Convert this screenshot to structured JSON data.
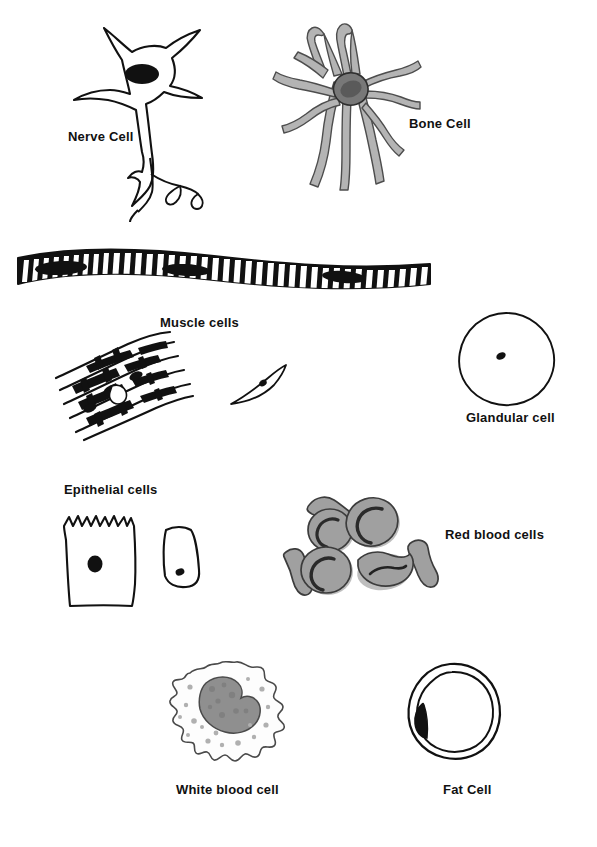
{
  "diagram": {
    "background_color": "#ffffff",
    "ink_color": "#111111",
    "gray_fill": "#a0a0a0",
    "gray_dark": "#6e6e6e",
    "gray_light": "#c8c8c8"
  },
  "cells": [
    {
      "id": "nerve-cell",
      "label": "Nerve Cell",
      "label_x": 68,
      "label_y": 130,
      "description": "Star-shaped neuron soma with black oval nucleus and long branching axon"
    },
    {
      "id": "bone-cell",
      "label": "Bone Cell",
      "label_x": 409,
      "label_y": 117,
      "description": "Osteocyte with gray body and many long branching processes"
    },
    {
      "id": "muscle-cells",
      "label": "Muscle cells",
      "label_x": 160,
      "label_y": 316,
      "description": "Long striated skeletal muscle fiber with dark banding"
    },
    {
      "id": "cardiac-muscle",
      "label": "",
      "label_x": 0,
      "label_y": 0,
      "description": "Branching cardiac muscle fibers with intercalated discs"
    },
    {
      "id": "smooth-muscle-cell",
      "label": "",
      "label_x": 0,
      "label_y": 0,
      "description": "Single spindle-shaped smooth muscle cell with central nucleus"
    },
    {
      "id": "glandular-cell",
      "label": "Glandular cell",
      "label_x": 466,
      "label_y": 411,
      "description": "Round cell outline with small dark central nucleus"
    },
    {
      "id": "epithelial-cells",
      "label": "Epithelial cells",
      "label_x": 64,
      "label_y": 483,
      "description": "Large square cell with microvilli and smaller trapezoid cell"
    },
    {
      "id": "red-blood-cells",
      "label": "Red blood cells",
      "label_x": 445,
      "label_y": 528,
      "description": "Gray biconcave discs with crescent depressions and edge-on views"
    },
    {
      "id": "white-blood-cell",
      "label": "White blood cell",
      "label_x": 176,
      "label_y": 783,
      "description": "Amoeboid cell with lobed outline and large dark bilobed nucleus"
    },
    {
      "id": "fat-cell",
      "label": "Fat Cell",
      "label_x": 443,
      "label_y": 783,
      "description": "Double-outlined cell with large lipid droplet and dark peripheral nucleus"
    }
  ]
}
